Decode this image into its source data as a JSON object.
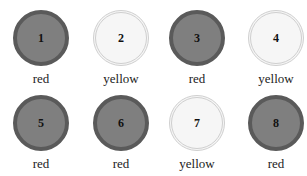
{
  "items": [
    {
      "number": "1",
      "label": "red"
    },
    {
      "number": "2",
      "label": "yellow"
    },
    {
      "number": "3",
      "label": "red"
    },
    {
      "number": "4",
      "label": "yellow"
    },
    {
      "number": "5",
      "label": "red"
    },
    {
      "number": "6",
      "label": "red"
    },
    {
      "number": "7",
      "label": "yellow"
    },
    {
      "number": "8",
      "label": "red"
    }
  ],
  "colors": {
    "red_fill": "#7f7f7f",
    "red_border": "#5a5a5a",
    "yellow_fill": "#f6f6f6",
    "yellow_border": "#cfcfcf"
  }
}
